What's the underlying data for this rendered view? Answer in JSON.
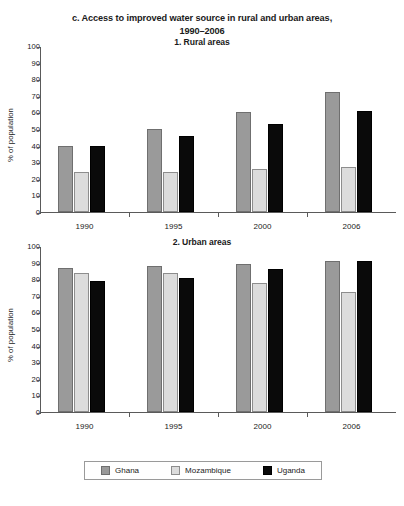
{
  "figure": {
    "title_line1": "c. Access to improved water source in rural and urban areas,",
    "title_line2": "1990–2006"
  },
  "legend": {
    "items": [
      {
        "label": "Ghana",
        "color": "#9a9a9a",
        "swatch": "ghana-swatch"
      },
      {
        "label": "Mozambique",
        "color": "#dcdcdc",
        "swatch": "mozambique-swatch"
      },
      {
        "label": "Uganda",
        "color": "#0a0a0a",
        "swatch": "uganda-swatch"
      }
    ]
  },
  "yticks": [
    "100",
    "90",
    "80",
    "70",
    "60",
    "50",
    "40",
    "30",
    "20",
    "10",
    "0"
  ],
  "chart_data": [
    {
      "type": "bar",
      "title": "1. Rural areas",
      "xlabel": "",
      "ylabel": "% of population",
      "ylim": [
        0,
        100
      ],
      "ytick_step": 10,
      "grid": false,
      "legend_position": "bottom",
      "categories": [
        "1990",
        "1995",
        "2000",
        "2006"
      ],
      "series": [
        {
          "name": "Ghana",
          "color": "#9a9a9a",
          "values": [
            40,
            50,
            60,
            72
          ]
        },
        {
          "name": "Mozambique",
          "color": "#dcdcdc",
          "values": [
            24,
            24,
            26,
            27
          ]
        },
        {
          "name": "Uganda",
          "color": "#0a0a0a",
          "values": [
            40,
            46,
            53,
            61
          ]
        }
      ]
    },
    {
      "type": "bar",
      "title": "2. Urban areas",
      "xlabel": "",
      "ylabel": "% of population",
      "ylim": [
        0,
        100
      ],
      "ytick_step": 10,
      "grid": false,
      "legend_position": "bottom",
      "categories": [
        "1990",
        "1995",
        "2000",
        "2006"
      ],
      "series": [
        {
          "name": "Ghana",
          "color": "#9a9a9a",
          "values": [
            87,
            88,
            89,
            91
          ]
        },
        {
          "name": "Mozambique",
          "color": "#dcdcdc",
          "values": [
            84,
            84,
            78,
            72
          ]
        },
        {
          "name": "Uganda",
          "color": "#0a0a0a",
          "values": [
            79,
            81,
            86,
            91
          ]
        }
      ]
    }
  ]
}
